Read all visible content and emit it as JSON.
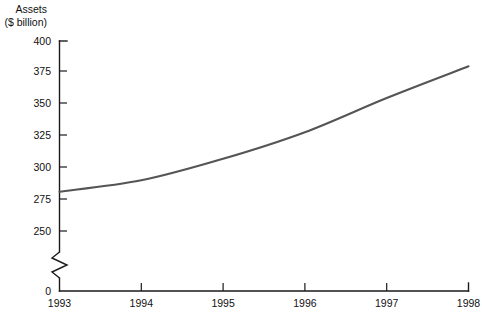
{
  "chart_data": {
    "type": "line",
    "title": "Assets",
    "subtitle": "($ billion)",
    "xlabel": "",
    "ylabel": "Assets ($ billion)",
    "x": [
      1993,
      1994,
      1995,
      1996,
      1997,
      1998
    ],
    "categories": [
      "1993",
      "1994",
      "1995",
      "1996",
      "1997",
      "1998"
    ],
    "values": [
      281,
      290,
      307,
      328,
      355,
      380
    ],
    "series": [
      {
        "name": "Assets",
        "values": [
          281,
          290,
          307,
          328,
          355,
          380
        ]
      }
    ],
    "ylim": [
      250,
      400
    ],
    "y_ticks": [
      250,
      275,
      300,
      325,
      350,
      375,
      400
    ],
    "y_tick_labels": [
      "250",
      "275",
      "300",
      "325",
      "350",
      "375",
      "400"
    ],
    "zero_label": "0",
    "axis_break": true,
    "x_ticks": [
      1993,
      1994,
      1995,
      1996,
      1997,
      1998
    ],
    "x_tick_labels": [
      "1993",
      "1994",
      "1995",
      "1996",
      "1997",
      "1998"
    ],
    "grid": false,
    "legend": false,
    "legend_position": "none",
    "line_color": "#555555",
    "axis_color": "#1a1a1a",
    "background": "#ffffff"
  },
  "labels": {
    "y_axis_title_line1": "Assets",
    "y_axis_title_line2": "($ billion)"
  }
}
